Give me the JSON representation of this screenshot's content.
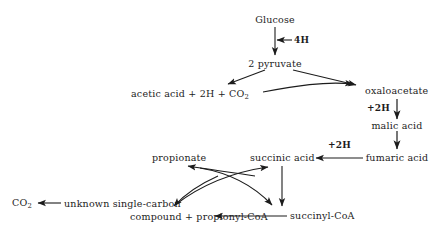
{
  "diagram": {
    "background_color": "#ffffff",
    "ink_color": "#1c1c1c",
    "nodes": {
      "glucose": "Glucose",
      "pyruvate": "2 pyruvate",
      "acetic_acid": "acetic acid + 2H + CO",
      "acetic_acid_sub": "2",
      "oxaloacetate": "oxaloacetate",
      "malic_acid": "malic acid",
      "fumaric_acid": "fumaric acid",
      "succinic_acid": "succinic acid",
      "propionate": "propionate",
      "succinyl_coa": "succinyl-CoA",
      "co2_left": "CO",
      "co2_left_sub": "2",
      "unknown_line1": "unknown single-carbon",
      "unknown_line2": "compound + propionyl-CoA"
    },
    "cofactors": {
      "glucose_to_pyruvate": "4H",
      "oxaloacetate_to_malic": "+2H",
      "fumaric_to_succinic": "+2H"
    },
    "caption": {
      "text": " "
    }
  }
}
